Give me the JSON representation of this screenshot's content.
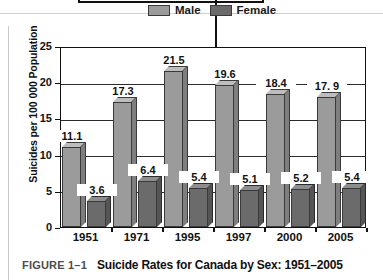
{
  "figure": {
    "label": "FIGURE 1–1",
    "title": "Suicide Rates for Canada by Sex: 1951–2005"
  },
  "legend": {
    "male_label": "Male",
    "female_label": "Female",
    "male_color": "#9b9b9b",
    "female_color": "#6b6b6b"
  },
  "chart_data": {
    "type": "bar",
    "title": "Suicide Rates for Canada by Sex: 1951–2005",
    "xlabel": "",
    "ylabel": "Suicides per 100 000 Population",
    "categories": [
      "1951",
      "1971",
      "1995",
      "1997",
      "2000",
      "2005"
    ],
    "series": [
      {
        "name": "Male",
        "color": "#9b9b9b",
        "values": [
          11.1,
          17.3,
          21.5,
          19.6,
          18.4,
          17.9
        ],
        "labels": [
          "11.1",
          "17.3",
          "21.5",
          "19.6",
          "18.4",
          "17. 9"
        ]
      },
      {
        "name": "Female",
        "color": "#6b6b6b",
        "values": [
          3.6,
          6.4,
          5.4,
          5.1,
          5.2,
          5.4
        ],
        "labels": [
          "3.6",
          "6.4",
          "5.4",
          "5.1",
          "5.2",
          "5.4"
        ]
      }
    ],
    "ylim": [
      0,
      25
    ],
    "yticks": [
      "0",
      "5",
      "10",
      "15",
      "20",
      "25"
    ],
    "grid": true,
    "legend_position": "top-right"
  },
  "annotation": {
    "arrow": "callout-arrow-pointing-to-1997-male-bar"
  }
}
